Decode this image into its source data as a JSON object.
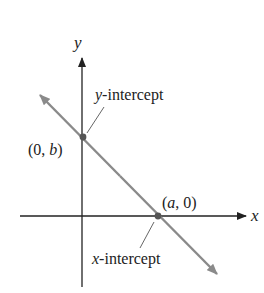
{
  "diagram": {
    "axes": {
      "x_label": "x",
      "y_label": "y"
    },
    "points": {
      "y_intercept": {
        "label_open": "(0, ",
        "label_var": "b",
        "label_close": ")"
      },
      "x_intercept": {
        "label_open": "(",
        "label_var": "a",
        "label_close": ", 0)"
      }
    },
    "annotations": {
      "y_intercept_var": "y",
      "y_intercept_text": "-intercept",
      "x_intercept_var": "x",
      "x_intercept_text": "-intercept"
    },
    "colors": {
      "axis": "#222222",
      "line": "#8a8a8a",
      "point": "#555555",
      "leader": "#666666"
    }
  }
}
